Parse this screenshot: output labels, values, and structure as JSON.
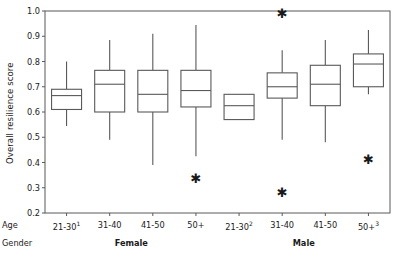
{
  "chart_data": {
    "type": "box",
    "title": "",
    "xlabel": "",
    "ylabel": "Overall resilience score",
    "ylim": [
      0.2,
      1.0
    ],
    "ytick_labels": [
      "1.0",
      "0.9",
      "0.8",
      "0.7",
      "0.6",
      "0.5",
      "0.4",
      "0.3",
      "0.2"
    ],
    "ytick_values": [
      1.0,
      0.9,
      0.8,
      0.7,
      0.6,
      0.5,
      0.4,
      0.3,
      0.2
    ],
    "grid": false,
    "legend": "none",
    "axis_row_labels": [
      "Age",
      "Gender"
    ],
    "groups": [
      {
        "label": "Female",
        "categories": [
          "21-30",
          "31-40",
          "41-50",
          "50+"
        ],
        "superscripts": [
          "1",
          "",
          "",
          ""
        ]
      },
      {
        "label": "Male",
        "categories": [
          "21-30",
          "31-40",
          "41-50",
          "50+"
        ],
        "superscripts": [
          "2",
          "",
          "",
          "3"
        ]
      }
    ],
    "categories": [
      "21-30",
      "31-40",
      "41-50",
      "50+",
      "21-30",
      "31-40",
      "41-50",
      "50+"
    ],
    "boxes": [
      {
        "gender": "Female",
        "age": "21-30",
        "whisker_low": 0.545,
        "q1": 0.61,
        "median": 0.665,
        "q3": 0.69,
        "whisker_high": 0.8,
        "outliers": []
      },
      {
        "gender": "Female",
        "age": "31-40",
        "whisker_low": 0.49,
        "q1": 0.6,
        "median": 0.71,
        "q3": 0.765,
        "whisker_high": 0.885,
        "outliers": []
      },
      {
        "gender": "Female",
        "age": "41-50",
        "whisker_low": 0.39,
        "q1": 0.6,
        "median": 0.67,
        "q3": 0.765,
        "whisker_high": 0.91,
        "outliers": []
      },
      {
        "gender": "Female",
        "age": "50+",
        "whisker_low": 0.425,
        "q1": 0.62,
        "median": 0.685,
        "q3": 0.765,
        "whisker_high": 0.945,
        "outliers": [
          0.335
        ]
      },
      {
        "gender": "Male",
        "age": "21-30",
        "whisker_low": 0.57,
        "q1": 0.57,
        "median": 0.625,
        "q3": 0.67,
        "whisker_high": 0.67,
        "outliers": []
      },
      {
        "gender": "Male",
        "age": "31-40",
        "whisker_low": 0.49,
        "q1": 0.655,
        "median": 0.7,
        "q3": 0.755,
        "whisker_high": 0.845,
        "outliers": [
          0.99,
          0.28
        ]
      },
      {
        "gender": "Male",
        "age": "41-50",
        "whisker_low": 0.48,
        "q1": 0.625,
        "median": 0.71,
        "q3": 0.785,
        "whisker_high": 0.885,
        "outliers": []
      },
      {
        "gender": "Male",
        "age": "50+",
        "whisker_low": 0.67,
        "q1": 0.7,
        "median": 0.79,
        "q3": 0.83,
        "whisker_high": 0.925,
        "outliers": [
          0.41
        ]
      }
    ],
    "colors": {
      "line": "#595959",
      "box_fill": "#ffffff",
      "outlier": "#1a1a1a",
      "axis": "#595959",
      "text": "#1a1a1a"
    }
  }
}
